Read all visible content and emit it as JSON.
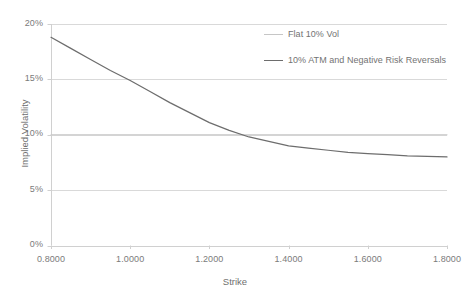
{
  "chart_data": {
    "type": "line",
    "title": "",
    "xlabel": "Strike",
    "ylabel": "Implied Volatility",
    "xlim": [
      0.8,
      1.8
    ],
    "ylim": [
      0,
      0.2
    ],
    "grid": true,
    "grid_axis": "y",
    "legend_position": "top-right",
    "x_tick_labels": [
      "0.8000",
      "1.0000",
      "1.2000",
      "1.4000",
      "1.6000",
      "1.8000"
    ],
    "x_tick_values": [
      0.8,
      1.0,
      1.2,
      1.4,
      1.6,
      1.8
    ],
    "y_tick_labels": [
      "0%",
      "5%",
      "10%",
      "15%",
      "20%"
    ],
    "y_tick_values": [
      0,
      0.05,
      0.1,
      0.15,
      0.2
    ],
    "series": [
      {
        "name": "Flat 10% Vol",
        "color": "#c6c6c6",
        "x": [
          0.8,
          0.9,
          1.0,
          1.1,
          1.2,
          1.3,
          1.4,
          1.5,
          1.6,
          1.7,
          1.8
        ],
        "values": [
          0.1,
          0.1,
          0.1,
          0.1,
          0.1,
          0.1,
          0.1,
          0.1,
          0.1,
          0.1,
          0.1
        ]
      },
      {
        "name": "10% ATM and Negative Risk Reversals",
        "color": "#6d6d6d",
        "x": [
          0.8,
          0.85,
          0.9,
          0.95,
          1.0,
          1.05,
          1.1,
          1.15,
          1.2,
          1.25,
          1.3,
          1.35,
          1.4,
          1.45,
          1.5,
          1.55,
          1.6,
          1.65,
          1.7,
          1.75,
          1.8
        ],
        "values": [
          0.188,
          0.178,
          0.168,
          0.158,
          0.149,
          0.139,
          0.129,
          0.12,
          0.111,
          0.104,
          0.098,
          0.094,
          0.09,
          0.088,
          0.086,
          0.084,
          0.083,
          0.082,
          0.081,
          0.0805,
          0.08
        ]
      }
    ]
  },
  "axes": {
    "x_title": "Strike",
    "y_title": "Implied Volatility"
  },
  "colors": {
    "gridline": "#d9d9d9",
    "axis": "#d0d0d0",
    "series_flat": "#c6c6c6",
    "series_skew": "#6d6d6d",
    "text": "#7b7b7b"
  }
}
